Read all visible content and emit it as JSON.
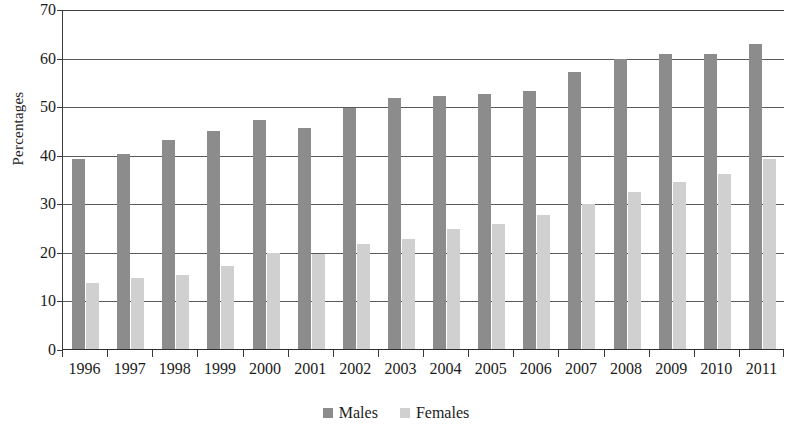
{
  "chart_data": {
    "type": "bar",
    "title": "",
    "subtitle": "",
    "xlabel": "",
    "ylabel": "Percentages",
    "ylim": [
      0,
      70
    ],
    "ytick_step": 10,
    "yticks": [
      70,
      60,
      50,
      40,
      30,
      20,
      10,
      0
    ],
    "grid": true,
    "grid_axis": "y",
    "legend_position": "bottom-center",
    "categories": [
      "1996",
      "1997",
      "1998",
      "1999",
      "2000",
      "2001",
      "2002",
      "2003",
      "2004",
      "2005",
      "2006",
      "2007",
      "2008",
      "2009",
      "2010",
      "2011"
    ],
    "series": [
      {
        "name": "Males",
        "color": "#8c8c8c",
        "values": [
          39.3,
          40.3,
          43.2,
          45.0,
          47.3,
          45.8,
          49.8,
          51.8,
          52.4,
          52.8,
          53.3,
          57.2,
          60.0,
          61.0,
          61.0,
          63.0
        ]
      },
      {
        "name": "Females",
        "color": "#d0d0d0",
        "values": [
          13.8,
          14.9,
          15.5,
          17.4,
          20.0,
          19.8,
          21.8,
          22.8,
          25.0,
          25.9,
          27.8,
          30.1,
          32.6,
          34.6,
          36.3,
          39.3
        ]
      }
    ]
  },
  "legend": {
    "items": [
      {
        "label": "Males",
        "color": "#8c8c8c"
      },
      {
        "label": "Females",
        "color": "#d0d0d0"
      }
    ]
  },
  "axis": {
    "y_title": "Percentages",
    "y_labels": [
      "70",
      "60",
      "50",
      "40",
      "30",
      "20",
      "10",
      "0"
    ],
    "x_labels": [
      "1996",
      "1997",
      "1998",
      "1999",
      "2000",
      "2001",
      "2002",
      "2003",
      "2004",
      "2005",
      "2006",
      "2007",
      "2008",
      "2009",
      "2010",
      "2011"
    ]
  },
  "colors": {
    "male_bar": "#8c8c8c",
    "female_bar": "#d0d0d0",
    "gridline": "#5a5a5a",
    "axis": "#2e2e2e",
    "background": "#ffffff"
  }
}
